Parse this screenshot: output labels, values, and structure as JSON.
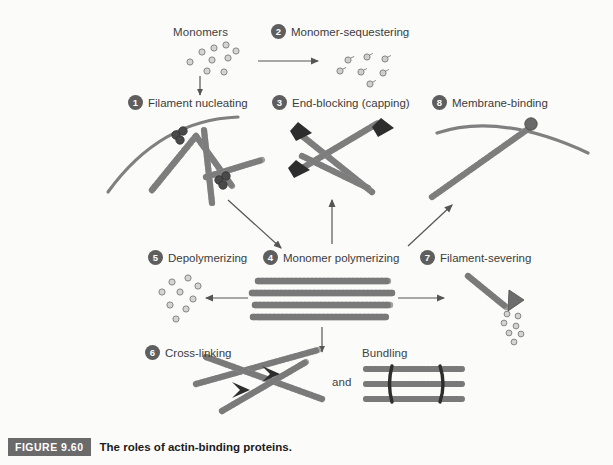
{
  "figure": {
    "tag": "FIGURE 9.60",
    "caption": "The roles of actin-binding proteins."
  },
  "labels": {
    "monomers": "Monomers",
    "and": "and",
    "bundling": "Bundling"
  },
  "steps": [
    {
      "number": "1",
      "label": "Filament nucleating"
    },
    {
      "number": "2",
      "label": "Monomer-sequestering"
    },
    {
      "number": "3",
      "label": "End-blocking (capping)"
    },
    {
      "number": "4",
      "label": "Monomer polymerizing"
    },
    {
      "number": "5",
      "label": "Depolymerizing"
    },
    {
      "number": "6",
      "label": "Cross-linking"
    },
    {
      "number": "7",
      "label": "Filament-severing"
    },
    {
      "number": "8",
      "label": "Membrane-binding"
    }
  ],
  "colors": {
    "background": "#fbfbfa",
    "filament": "#9a9a9a",
    "filament_outline": "#6e6e6e",
    "accent_dark": "#3a3a3a",
    "badge": "#5e5e5e",
    "membrane": "#7a7a7a",
    "caption_tag": "#6a6a6a",
    "text": "#3b3b3b"
  }
}
